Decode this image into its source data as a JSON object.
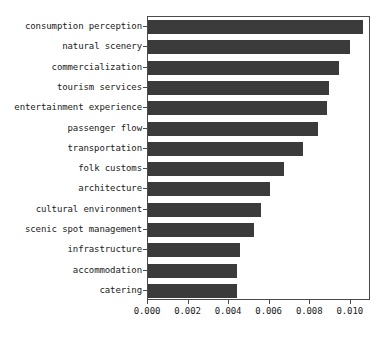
{
  "chart_data": {
    "type": "bar",
    "orientation": "horizontal",
    "title": "",
    "xlabel": "",
    "ylabel": "",
    "xlim": [
      0.0,
      0.011
    ],
    "xticks": [
      "0.000",
      "0.002",
      "0.004",
      "0.006",
      "0.008",
      "0.010"
    ],
    "xtick_values": [
      0.0,
      0.002,
      0.004,
      0.006,
      0.008,
      0.01
    ],
    "grid": false,
    "legend": false,
    "bar_color": "#3b3b3b",
    "axis_color": "#4a4a4a",
    "background_color": "#ffffff",
    "categories": [
      "consumption perception",
      "natural scenery",
      "commercialization",
      "tourism services",
      "entertainment experience",
      "passenger flow",
      "transportation",
      "folk customs",
      "architecture",
      "cultural environment",
      "scenic spot management",
      "infrastructure",
      "accommodation",
      "catering"
    ],
    "values": [
      0.0106,
      0.00997,
      0.00944,
      0.00893,
      0.00883,
      0.00838,
      0.00766,
      0.0067,
      0.00602,
      0.00558,
      0.00525,
      0.00454,
      0.00437,
      0.00438
    ]
  }
}
